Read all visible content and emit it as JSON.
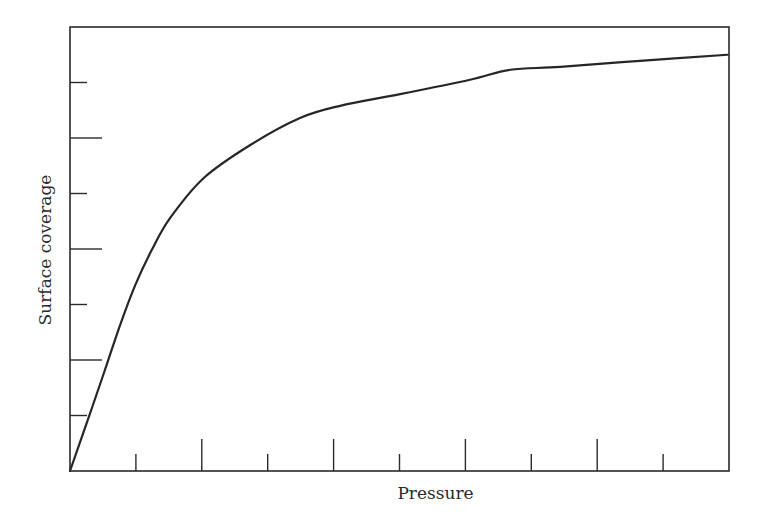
{
  "chart_data": {
    "type": "line",
    "title": "",
    "xlabel": "Pressure",
    "ylabel": "Surface coverage",
    "xlim": [
      0,
      10
    ],
    "ylim": [
      0,
      8
    ],
    "grid": false,
    "legend": null,
    "x_ticks": {
      "major": [
        2,
        4,
        6,
        8
      ],
      "minor": [
        1,
        3,
        5,
        7,
        9
      ],
      "labels": []
    },
    "y_ticks": {
      "major": [
        2,
        4,
        6
      ],
      "minor": [
        1,
        3,
        5,
        7
      ],
      "labels": []
    },
    "series": [
      {
        "name": "Adsorption isotherm",
        "color": "#262626",
        "x": [
          0,
          0.27,
          0.53,
          0.76,
          0.99,
          1.24,
          1.52,
          2.03,
          2.73,
          3.49,
          4.1,
          5.01,
          6.07,
          6.68,
          7.44,
          8.65,
          9.98
        ],
        "y": [
          0,
          0.92,
          1.82,
          2.63,
          3.35,
          3.98,
          4.56,
          5.28,
          5.87,
          6.36,
          6.58,
          6.79,
          7.05,
          7.23,
          7.28,
          7.39,
          7.5
        ]
      }
    ]
  },
  "layout": {
    "plot_left": 70,
    "plot_right": 729,
    "plot_top": 27,
    "plot_bottom": 471,
    "major_tick_len": 32,
    "minor_tick_len": 17
  }
}
